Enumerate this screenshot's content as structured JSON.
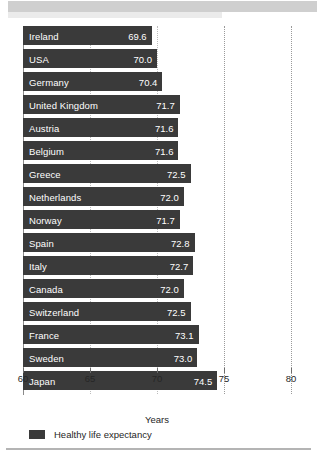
{
  "chart_data": {
    "type": "bar",
    "orientation": "horizontal",
    "title": "",
    "xlabel": "Years",
    "ylabel": "",
    "xlim": [
      60,
      80
    ],
    "grid": true,
    "gridlines": [
      65,
      70,
      75,
      80
    ],
    "xticks": [
      "60",
      "65",
      "70",
      "75",
      "80"
    ],
    "xtick_values": [
      60,
      65,
      70,
      75,
      80
    ],
    "legend": [
      {
        "label": "Healthy life expectancy",
        "color": "#3a3a3a"
      }
    ],
    "legend_position": "bottom-left",
    "categories": [
      "Ireland",
      "USA",
      "Germany",
      "United Kingdom",
      "Austria",
      "Belgium",
      "Greece",
      "Netherlands",
      "Norway",
      "Spain",
      "Italy",
      "Canada",
      "Switzerland",
      "France",
      "Sweden",
      "Japan"
    ],
    "values": [
      69.6,
      70.0,
      70.4,
      71.7,
      71.6,
      71.6,
      72.5,
      72.0,
      71.7,
      72.8,
      72.7,
      72.0,
      72.5,
      73.1,
      73.0,
      74.5
    ],
    "value_labels": [
      "69.6",
      "70.0",
      "70.4",
      "71.7",
      "71.6",
      "71.6",
      "72.5",
      "72.0",
      "71.7",
      "72.8",
      "72.7",
      "72.0",
      "72.5",
      "73.1",
      "73.0",
      "74.5"
    ],
    "bar_color": "#3a3a3a",
    "label_color": "#ffffff"
  },
  "colors": {
    "bar": "#3a3a3a",
    "value_text": "#ffffff",
    "axis_text": "#262626",
    "gridline": "#9a9a9a",
    "top_band": "#cfcfcf",
    "bottom_rule": "#b4b4b4"
  }
}
